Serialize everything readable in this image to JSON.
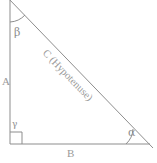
{
  "figure": {
    "kind": "right-triangle-diagram",
    "background_color": "#ffffff",
    "stroke_color": "#8d8d8d",
    "text_color": "#9a9a9a"
  },
  "labels": {
    "side_a": "A",
    "side_b": "B",
    "hypotenuse": "C (Hypotenuse)",
    "angle_alpha": "α",
    "angle_beta": "β",
    "angle_gamma": "γ"
  },
  "geometry": {
    "vertex_top": [
      10,
      0
    ],
    "vertex_bottom_left": [
      10,
      144
    ],
    "vertex_bottom_right": [
      148,
      144
    ],
    "right_angle_marker": {
      "x": 10,
      "y": 132,
      "size": 12
    },
    "arc_beta": {
      "cx": 10,
      "cy": 0,
      "radius": 22
    },
    "arc_alpha": {
      "cx": 148,
      "cy": 144,
      "radius": 22
    }
  }
}
